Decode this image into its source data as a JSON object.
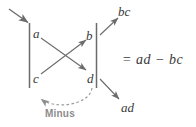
{
  "figure": {
    "name": "determinant-cross-multiplication-diagram",
    "line_color": "#6b6b6b",
    "text_color": "#3a3a3a",
    "label_color": "#8c8c8c",
    "background": "#ffffff"
  },
  "matrix": {
    "bar_left_label": "matrix-bar-left",
    "bar_right_label": "matrix-bar-right",
    "entries": {
      "a": "a",
      "b": "b",
      "c": "c",
      "d": "d"
    }
  },
  "products": {
    "bc": "bc",
    "ad": "ad"
  },
  "equation": {
    "text": "= ad − bc"
  },
  "annotations": {
    "minus": "Minus"
  },
  "arrows": {
    "incoming": "incoming-arrow",
    "a_to_d": "arrow-a-to-d",
    "c_to_b": "arrow-c-to-b",
    "b_to_bc": "arrow-b-to-bc",
    "d_to_ad": "arrow-d-to-ad",
    "minus_curve": "dashed-minus-arc"
  }
}
